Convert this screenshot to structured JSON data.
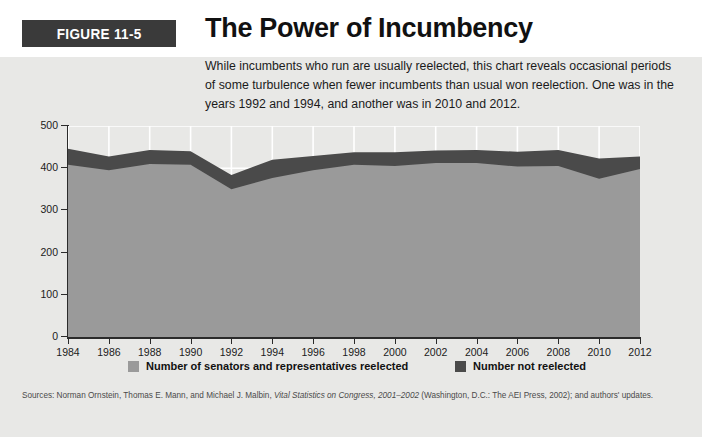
{
  "figure": {
    "badge": "FIGURE 11-5",
    "title": "The Power of Incumbency",
    "intro": "While incumbents who run are usually reelected, this chart reveals occasional periods of some turbulence when fewer incumbents than usual won reelection. One was in the years 1992 and 1994, and another was in 2010 and 2012.",
    "source_prefix": "Sources: Norman Ornstein, Thomas E. Mann, and Michael J. Malbin, ",
    "source_italic": "Vital Statistics on Congress, 2001–2002",
    "source_suffix": " (Washington, D.C.: The AEI Press, 2002); and authors' updates."
  },
  "colors": {
    "badge_background": "#3a3a3a",
    "badge_text": "#ffffff",
    "panel_background": "#e8e8e6",
    "reelected_fill": "#9a9a9a",
    "not_reelected_fill": "#4a4a4a",
    "axis": "#2b2b2b",
    "gridline": "#ffffff",
    "text": "#1b1b1b"
  },
  "legend": {
    "position": "bottom",
    "items": [
      {
        "label": "Number of senators and representatives reelected",
        "color": "#9a9a9a",
        "swatch": "legend-swatch-light"
      },
      {
        "label": "Number not reelected",
        "color": "#4a4a4a",
        "swatch": "legend-swatch-dark"
      }
    ]
  },
  "chart_data": {
    "type": "area",
    "stacked": true,
    "title": "The Power of Incumbency",
    "xlabel": "",
    "ylabel": "",
    "xlim": [
      1984,
      2012
    ],
    "ylim": [
      0,
      500
    ],
    "yticks": [
      0,
      100,
      200,
      300,
      400,
      500
    ],
    "grid": "vertical-and-horizontal-white",
    "categories": [
      1984,
      1986,
      1988,
      1990,
      1992,
      1994,
      1996,
      1998,
      2000,
      2002,
      2004,
      2006,
      2008,
      2010,
      2012
    ],
    "x": [
      "1984",
      "1986",
      "1988",
      "1990",
      "1992",
      "1994",
      "1996",
      "1998",
      "2000",
      "2002",
      "2004",
      "2006",
      "2008",
      "2010",
      "2012"
    ],
    "series": [
      {
        "name": "Number of senators and representatives reelected",
        "color": "#9a9a9a",
        "values": [
          408,
          395,
          410,
          408,
          350,
          377,
          395,
          408,
          405,
          412,
          412,
          404,
          405,
          375,
          398
        ]
      },
      {
        "name": "Number not reelected",
        "color": "#4a4a4a",
        "values": [
          38,
          33,
          33,
          32,
          34,
          43,
          34,
          30,
          33,
          30,
          31,
          35,
          38,
          48,
          30
        ]
      }
    ],
    "totals": [
      446,
      428,
      443,
      440,
      384,
      420,
      429,
      438,
      438,
      442,
      443,
      439,
      443,
      423,
      428
    ]
  }
}
